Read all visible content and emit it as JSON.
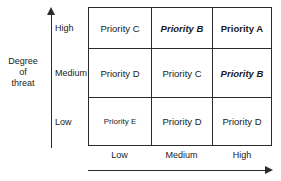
{
  "chart_data": {
    "type": "heatmap",
    "title": "",
    "xlabel": "",
    "ylabel": "Degree of threat",
    "x_categories": [
      "Low",
      "Medium",
      "High"
    ],
    "y_categories": [
      "High",
      "Medium",
      "Low"
    ],
    "cells": [
      [
        {
          "label": "Priority C",
          "style": "regular"
        },
        {
          "label": "Priority B",
          "style": "italic"
        },
        {
          "label": "Priority A",
          "style": "bold"
        }
      ],
      [
        {
          "label": "Priority D",
          "style": "regular"
        },
        {
          "label": "Priority C",
          "style": "regular"
        },
        {
          "label": "Priority B",
          "style": "italic"
        }
      ],
      [
        {
          "label": "Priority E",
          "style": "small"
        },
        {
          "label": "Priority D",
          "style": "regular"
        },
        {
          "label": "Priority D",
          "style": "regular"
        }
      ]
    ],
    "grid": true,
    "legend": "none"
  },
  "axes": {
    "y": {
      "title_lines": [
        "Degree",
        "of",
        "threat"
      ],
      "ticks": [
        "High",
        "Medium",
        "Low"
      ],
      "arrow": "up-arrow-icon"
    },
    "x": {
      "title": "",
      "ticks": [
        "Low",
        "Medium",
        "High"
      ],
      "arrow": "right-arrow-icon"
    }
  }
}
